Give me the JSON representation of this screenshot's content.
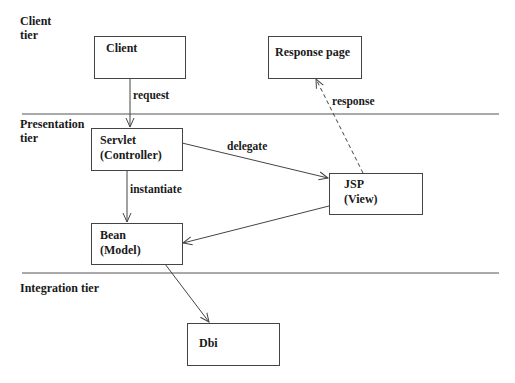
{
  "diagram": {
    "tiers": [
      {
        "id": "client",
        "label": "Client\ntier"
      },
      {
        "id": "presentation",
        "label": "Presentation\ntier"
      },
      {
        "id": "integration",
        "label": "Integration tier"
      }
    ],
    "nodes": [
      {
        "id": "client",
        "label": "Client"
      },
      {
        "id": "response_page",
        "label": "Response page"
      },
      {
        "id": "servlet",
        "label": "Servlet\n(Controller)"
      },
      {
        "id": "jsp",
        "label": "JSP\n(View)"
      },
      {
        "id": "bean",
        "label": "Bean\n (Model)"
      },
      {
        "id": "dbi",
        "label": "Dbi"
      }
    ],
    "edges": [
      {
        "from": "client",
        "to": "servlet",
        "label": "request",
        "style": "solid"
      },
      {
        "from": "servlet",
        "to": "jsp",
        "label": "delegate",
        "style": "solid"
      },
      {
        "from": "servlet",
        "to": "bean",
        "label": "instantiate",
        "style": "solid"
      },
      {
        "from": "jsp",
        "to": "bean",
        "label": "",
        "style": "solid"
      },
      {
        "from": "jsp",
        "to": "response_page",
        "label": "response",
        "style": "dashed"
      },
      {
        "from": "bean",
        "to": "dbi",
        "label": "",
        "style": "solid"
      }
    ],
    "colors": {
      "line": "#444444",
      "tier_line": "#555555",
      "text": "#1a1a1a",
      "background": "#ffffff"
    }
  }
}
